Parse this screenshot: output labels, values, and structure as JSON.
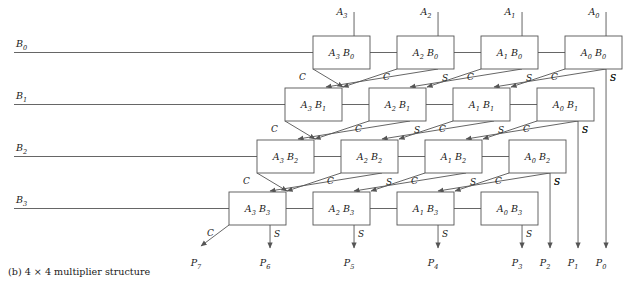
{
  "caption": "(b) 4 × 4 multiplier structure",
  "geometry": {
    "box_w": 57,
    "box_h": 33,
    "col_pitch": 84,
    "row_pitch": 52,
    "row_shift": 28,
    "row0_right_x": 565,
    "row0_top_y": 36
  },
  "signals": {
    "carry_label": "C",
    "sum_label": "S"
  },
  "a_inputs": [
    {
      "name": "A3",
      "base": "A",
      "sub": "3"
    },
    {
      "name": "A2",
      "base": "A",
      "sub": "2"
    },
    {
      "name": "A1",
      "base": "A",
      "sub": "1"
    },
    {
      "name": "A0",
      "base": "A",
      "sub": "0"
    }
  ],
  "b_inputs": [
    {
      "name": "B0",
      "base": "B",
      "sub": "0"
    },
    {
      "name": "B1",
      "base": "B",
      "sub": "1"
    },
    {
      "name": "B2",
      "base": "B",
      "sub": "2"
    },
    {
      "name": "B3",
      "base": "B",
      "sub": "3"
    }
  ],
  "rows": [
    {
      "b": "B0",
      "cells": [
        {
          "label": "A3 B0",
          "a": "A",
          "a_sub": "3",
          "b": "B",
          "b_sub": "0"
        },
        {
          "label": "A2 B0",
          "a": "A",
          "a_sub": "2",
          "b": "B",
          "b_sub": "0"
        },
        {
          "label": "A1 B0",
          "a": "A",
          "a_sub": "1",
          "b": "B",
          "b_sub": "0"
        },
        {
          "label": "A0 B0",
          "a": "A",
          "a_sub": "0",
          "b": "B",
          "b_sub": "0"
        }
      ]
    },
    {
      "b": "B1",
      "cells": [
        {
          "label": "A3 B1",
          "a": "A",
          "a_sub": "3",
          "b": "B",
          "b_sub": "1"
        },
        {
          "label": "A2 B1",
          "a": "A",
          "a_sub": "2",
          "b": "B",
          "b_sub": "1"
        },
        {
          "label": "A1 B1",
          "a": "A",
          "a_sub": "1",
          "b": "B",
          "b_sub": "1"
        },
        {
          "label": "A0 B1",
          "a": "A",
          "a_sub": "0",
          "b": "B",
          "b_sub": "1"
        }
      ]
    },
    {
      "b": "B2",
      "cells": [
        {
          "label": "A3 B2",
          "a": "A",
          "a_sub": "3",
          "b": "B",
          "b_sub": "2"
        },
        {
          "label": "A2 B2",
          "a": "A",
          "a_sub": "2",
          "b": "B",
          "b_sub": "2"
        },
        {
          "label": "A1 B2",
          "a": "A",
          "a_sub": "1",
          "b": "B",
          "b_sub": "2"
        },
        {
          "label": "A0 B2",
          "a": "A",
          "a_sub": "0",
          "b": "B",
          "b_sub": "2"
        }
      ]
    },
    {
      "b": "B3",
      "cells": [
        {
          "label": "A3 B3",
          "a": "A",
          "a_sub": "3",
          "b": "B",
          "b_sub": "3"
        },
        {
          "label": "A2 B3",
          "a": "A",
          "a_sub": "2",
          "b": "B",
          "b_sub": "3"
        },
        {
          "label": "A1 B3",
          "a": "A",
          "a_sub": "1",
          "b": "B",
          "b_sub": "3"
        },
        {
          "label": "A0 B3",
          "a": "A",
          "a_sub": "0",
          "b": "B",
          "b_sub": "3"
        }
      ]
    }
  ],
  "p_outputs": [
    {
      "name": "P7",
      "base": "P",
      "sub": "7",
      "source": "carry-row3-col0"
    },
    {
      "name": "P6",
      "base": "P",
      "sub": "6",
      "source": "sum-row3-col0"
    },
    {
      "name": "P5",
      "base": "P",
      "sub": "5",
      "source": "sum-row3-col1"
    },
    {
      "name": "P4",
      "base": "P",
      "sub": "4",
      "source": "sum-row3-col2"
    },
    {
      "name": "P3",
      "base": "P",
      "sub": "3",
      "source": "sum-row3-col3"
    },
    {
      "name": "P2",
      "base": "P",
      "sub": "2",
      "source": "sum-row2-col3"
    },
    {
      "name": "P1",
      "base": "P",
      "sub": "1",
      "source": "sum-row1-col3"
    },
    {
      "name": "P0",
      "base": "P",
      "sub": "0",
      "source": "sum-row0-col3"
    }
  ],
  "colors": {
    "line": "#555555",
    "text": "#1a1a1a",
    "background": "#ffffff"
  }
}
